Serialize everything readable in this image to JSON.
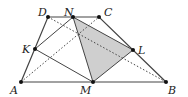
{
  "diagram": {
    "type": "geometry-trapezoid",
    "points": {
      "A": {
        "label": "A",
        "x": 21,
        "y": 82
      },
      "B": {
        "label": "B",
        "x": 166,
        "y": 82
      },
      "C": {
        "label": "C",
        "x": 99,
        "y": 17
      },
      "D": {
        "label": "D",
        "x": 48,
        "y": 17
      },
      "K": {
        "label": "K",
        "x": 35,
        "y": 49
      },
      "L": {
        "label": "L",
        "x": 133,
        "y": 50
      },
      "M": {
        "label": "M",
        "x": 93,
        "y": 82
      },
      "N": {
        "label": "N",
        "x": 73,
        "y": 17
      }
    },
    "shaded_triangle": [
      "N",
      "L",
      "M"
    ],
    "shade_color": "#cfcfcf",
    "line_color": "#444444",
    "dotted_segments": [
      [
        "D",
        "B"
      ],
      [
        "A",
        "C"
      ]
    ]
  }
}
